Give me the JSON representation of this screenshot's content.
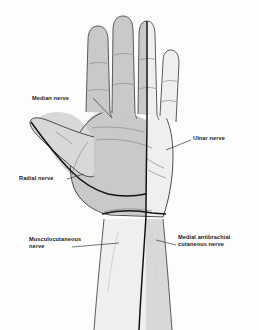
{
  "figure": {
    "view": "palmar (anterior) view of left hand",
    "background_color": "#fdfdfd"
  },
  "labels": {
    "median": "Median nerve",
    "ulnar": "Ulnar nerve",
    "radial": "Radial nerve",
    "musculocutaneous_line1": "Musculocutaneous",
    "musculocutaneous_line2": "nerve",
    "medial_antibrachial_line1": "Medial antibrachial",
    "medial_antibrachial_line2": "cutaneous nerve"
  },
  "colors": {
    "outline": "#4a4a4a",
    "nerve_boundary": "#141414",
    "shade_dark": "#c9c9c9",
    "shade_mid": "#d8d8d8",
    "shade_light": "#efefef",
    "crease": "#8d8d8d",
    "leader": "#3a3a3a",
    "text": "#1a1a1a"
  },
  "regions": [
    {
      "name": "median-territory",
      "shade": "#c9c9c9",
      "description": "thumb, index, middle and radial half of ring finger with adjacent palm"
    },
    {
      "name": "ulnar-territory",
      "shade": "#efefef",
      "description": "little finger, ulnar half of ring finger and ulnar palm"
    },
    {
      "name": "radial-territory",
      "shade": "#d8d8d8",
      "description": "radial border of thumb and thenar margin"
    },
    {
      "name": "musculocutaneous-territory",
      "shade": "#efefef",
      "description": "radial side of forearm"
    },
    {
      "name": "medial-antibrachial-territory",
      "shade": "#d8d8d8",
      "description": "ulnar side of forearm"
    }
  ]
}
